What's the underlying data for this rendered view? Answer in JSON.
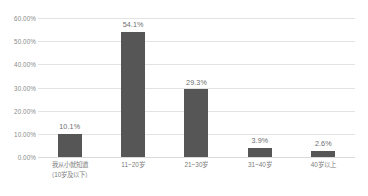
{
  "chart_data": {
    "type": "bar",
    "title": "",
    "subtitle": "",
    "xlabel": "",
    "ylabel": "",
    "ylim": [
      0,
      60
    ],
    "grid": true,
    "legend": false,
    "legend_position": "none",
    "bar_color": "#565656",
    "gridline_color": "#e3e3e3",
    "categories": [
      "我从小就知道（10岁及以下）",
      "11~20岁",
      "21~30岁",
      "31~40岁",
      "40岁以上"
    ],
    "category_lines": [
      [
        "我从小就知道",
        "（10岁及以下）"
      ],
      [
        "11~20岁",
        ""
      ],
      [
        "21~30岁",
        ""
      ],
      [
        "31~40岁",
        ""
      ],
      [
        "40岁以上",
        ""
      ]
    ],
    "values": [
      10.1,
      54.1,
      29.3,
      3.9,
      2.6
    ],
    "data_labels": [
      "10.1%",
      "54.1%",
      "29.3%",
      "3.9%",
      "2.6%"
    ],
    "yticks": [
      0,
      10,
      20,
      30,
      40,
      50,
      60
    ],
    "ytick_labels": [
      "0.00%",
      "10.00%",
      "20.00%",
      "30.00%",
      "40.00%",
      "50.00%",
      "60.00%"
    ]
  }
}
